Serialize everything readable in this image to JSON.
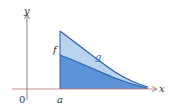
{
  "diagram": {
    "title": "",
    "labels": {
      "y_axis": "y",
      "x_axis": "x",
      "origin": "0",
      "a": "a",
      "f": "f",
      "g": "g"
    },
    "colors": {
      "axis": "#555555",
      "x_axis_red": "#c85050",
      "upper_fill": "#b9d3ee",
      "lower_fill": "#5b93d6",
      "curve": "#2a5ea8",
      "curve_light": "#ffffff"
    }
  }
}
